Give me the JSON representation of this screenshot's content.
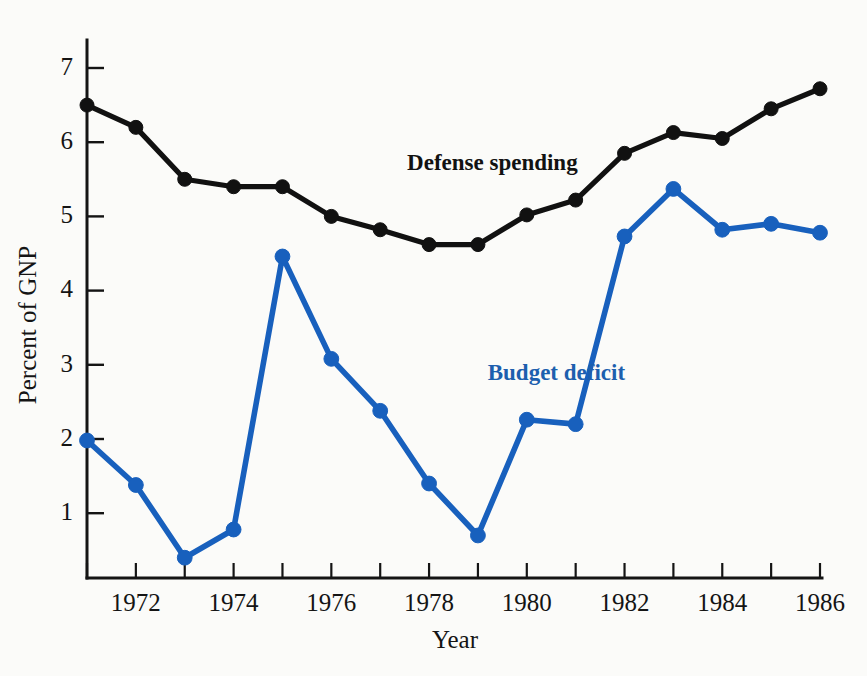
{
  "chart_data": {
    "type": "line",
    "title": "",
    "xlabel": "Year",
    "ylabel": "Percent of GNP",
    "x": [
      1971,
      1972,
      1973,
      1974,
      1975,
      1976,
      1977,
      1978,
      1979,
      1980,
      1981,
      1982,
      1983,
      1984,
      1985,
      1986
    ],
    "xlim": [
      1971,
      1986
    ],
    "ylim": [
      0.1,
      7.4
    ],
    "yticks": [
      1,
      2,
      3,
      4,
      5,
      6,
      7
    ],
    "ytick_labels": [
      "1",
      "2",
      "3",
      "4",
      "5",
      "6",
      "7"
    ],
    "xticks": [
      1971,
      1972,
      1973,
      1974,
      1975,
      1976,
      1977,
      1978,
      1979,
      1980,
      1981,
      1982,
      1983,
      1984,
      1985,
      1986
    ],
    "xtick_labels": [
      "",
      "1972",
      "",
      "1974",
      "",
      "1976",
      "",
      "1978",
      "",
      "1980",
      "",
      "1982",
      "",
      "1984",
      "",
      "1986"
    ],
    "grid": false,
    "legend_position": "inline-annotation",
    "series": [
      {
        "name": "Defense spending",
        "color": "#111111",
        "label_x": 1977.55,
        "label_y": 5.62,
        "values": [
          6.5,
          6.2,
          5.5,
          5.4,
          5.4,
          5.0,
          4.82,
          4.62,
          4.62,
          5.02,
          5.22,
          5.85,
          6.13,
          6.05,
          6.45,
          6.72
        ]
      },
      {
        "name": "Budget deficit",
        "color": "#1d5fae",
        "label_x": 1979.2,
        "label_y": 2.8,
        "values": [
          1.98,
          1.38,
          0.4,
          0.78,
          4.46,
          3.08,
          2.38,
          1.4,
          0.7,
          2.26,
          2.2,
          4.73,
          5.37,
          4.82,
          4.9,
          4.78
        ]
      }
    ]
  },
  "figure": {
    "background_color": "#fbfbf9",
    "axis_color": "#141414"
  }
}
